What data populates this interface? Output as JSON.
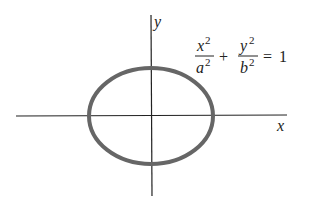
{
  "diagram": {
    "equation": {
      "term1": {
        "numerator": "x",
        "numerator_exp": "2",
        "denominator": "a",
        "denominator_exp": "2"
      },
      "operator": "+",
      "term2": {
        "numerator": "y",
        "numerator_exp": "2",
        "denominator": "b",
        "denominator_exp": "2"
      },
      "equals": "=",
      "rhs": "1"
    },
    "axes": {
      "x_label": "x",
      "y_label": "y"
    },
    "ellipse": {
      "cx": 151,
      "cy": 116,
      "rx": 62,
      "ry": 48,
      "stroke": "#666666",
      "stroke_width": 4
    },
    "colors": {
      "axis": "#222222",
      "curve": "#666666",
      "background": "#ffffff"
    }
  }
}
